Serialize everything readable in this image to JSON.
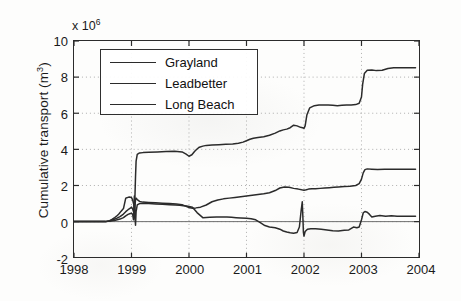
{
  "chart_data": {
    "type": "line",
    "title": "",
    "subtitle": "",
    "xlabel": "",
    "ylabel": "Cumulative transport (m3)",
    "ylabel_display": "Cumulative transport (m",
    "ylabel_sup": "3",
    "ylabel_tail": ")",
    "y_exponent_prefix": "x 10",
    "y_exponent_power": "6",
    "y_scale": 1000000,
    "xlim": [
      1998,
      2004
    ],
    "ylim": [
      -2,
      10
    ],
    "grid": true,
    "legend_position": "upper-left",
    "xticks": [
      "1998",
      "1999",
      "2000",
      "2001",
      "2002",
      "2003",
      "2004"
    ],
    "yticks": [
      "-2",
      "0",
      "2",
      "4",
      "6",
      "8",
      "10"
    ],
    "series": [
      {
        "name": "Grayland",
        "color": "#2b2b2b",
        "x": [
          1998.0,
          1998.55,
          1998.62,
          1998.66,
          1998.7,
          1998.74,
          1998.78,
          1998.82,
          1998.86,
          1998.9,
          1998.92,
          1998.94,
          1998.96,
          1998.98,
          1999.0,
          1999.02,
          1999.04,
          1999.05,
          1999.06,
          1999.07,
          1999.08,
          1999.1,
          1999.14,
          1999.2,
          1999.3,
          1999.45,
          1999.6,
          1999.75,
          1999.88,
          1999.95,
          2000.0,
          2000.05,
          2000.1,
          2000.14,
          2000.18,
          2000.24,
          2000.3,
          2000.4,
          2000.52,
          2000.64,
          2000.76,
          2000.86,
          2000.94,
          2001.0,
          2001.06,
          2001.12,
          2001.2,
          2001.3,
          2001.4,
          2001.5,
          2001.58,
          2001.64,
          2001.7,
          2001.76,
          2001.82,
          2001.88,
          2001.94,
          2001.99,
          2002.0,
          2002.02,
          2002.05,
          2002.1,
          2002.18,
          2002.26,
          2002.34,
          2002.42,
          2002.5,
          2002.58,
          2002.66,
          2002.74,
          2002.82,
          2002.9,
          2002.96,
          2003.0,
          2003.02,
          2003.05,
          2003.1,
          2003.18,
          2003.26,
          2003.36,
          2003.46,
          2003.56,
          2003.66,
          2003.76,
          2003.86,
          2003.94
        ],
        "y": [
          0.0,
          0.0,
          0.05,
          0.12,
          0.2,
          0.3,
          0.42,
          0.58,
          0.72,
          1.3,
          1.32,
          1.34,
          1.36,
          1.35,
          1.33,
          1.2,
          0.95,
          0.6,
          1.4,
          2.5,
          3.35,
          3.72,
          3.8,
          3.82,
          3.84,
          3.86,
          3.88,
          3.9,
          3.86,
          3.74,
          3.62,
          3.7,
          3.9,
          4.02,
          4.12,
          4.18,
          4.22,
          4.24,
          4.26,
          4.28,
          4.3,
          4.34,
          4.4,
          4.48,
          4.56,
          4.62,
          4.66,
          4.7,
          4.78,
          4.9,
          5.02,
          5.08,
          5.12,
          5.2,
          5.34,
          5.3,
          5.22,
          5.18,
          5.16,
          5.3,
          5.9,
          6.3,
          6.42,
          6.46,
          6.46,
          6.46,
          6.44,
          6.42,
          6.44,
          6.46,
          6.46,
          6.48,
          6.55,
          6.9,
          7.6,
          8.2,
          8.38,
          8.4,
          8.36,
          8.38,
          8.48,
          8.52,
          8.52,
          8.52,
          8.52,
          8.52
        ]
      },
      {
        "name": "Leadbetter",
        "color": "#2b2b2b",
        "x": [
          1998.0,
          1998.55,
          1998.62,
          1998.68,
          1998.74,
          1998.8,
          1998.86,
          1998.9,
          1998.94,
          1998.98,
          1999.0,
          1999.02,
          1999.04,
          1999.05,
          1999.06,
          1999.07,
          1999.08,
          1999.1,
          1999.14,
          1999.2,
          1999.3,
          1999.42,
          1999.54,
          1999.66,
          1999.78,
          1999.88,
          1999.94,
          2000.0,
          2000.06,
          2000.12,
          2000.2,
          2000.3,
          2000.4,
          2000.5,
          2000.6,
          2000.7,
          2000.8,
          2000.9,
          2001.0,
          2001.1,
          2001.2,
          2001.3,
          2001.4,
          2001.5,
          2001.58,
          2001.66,
          2001.74,
          2001.82,
          2001.9,
          2001.96,
          2002.0,
          2002.04,
          2002.08,
          2002.14,
          2002.2,
          2002.28,
          2002.36,
          2002.44,
          2002.52,
          2002.6,
          2002.7,
          2002.8,
          2002.9,
          2002.96,
          2003.0,
          2003.03,
          2003.06,
          2003.1,
          2003.18,
          2003.28,
          2003.4,
          2003.52,
          2003.64,
          2003.76,
          2003.86,
          2003.94
        ],
        "y": [
          0.0,
          0.0,
          0.04,
          0.1,
          0.18,
          0.28,
          0.42,
          0.55,
          0.66,
          0.74,
          0.8,
          0.7,
          0.5,
          0.3,
          0.85,
          1.22,
          1.3,
          1.22,
          1.12,
          1.08,
          1.06,
          1.04,
          1.02,
          1.0,
          0.98,
          0.94,
          0.86,
          0.78,
          0.74,
          0.76,
          0.8,
          0.92,
          1.1,
          1.2,
          1.26,
          1.3,
          1.34,
          1.38,
          1.42,
          1.46,
          1.5,
          1.54,
          1.6,
          1.72,
          1.86,
          1.92,
          1.9,
          1.84,
          1.8,
          1.76,
          1.74,
          1.76,
          1.8,
          1.82,
          1.82,
          1.84,
          1.86,
          1.88,
          1.9,
          1.92,
          1.94,
          1.96,
          2.0,
          2.1,
          2.35,
          2.7,
          2.88,
          2.92,
          2.9,
          2.88,
          2.9,
          2.9,
          2.9,
          2.9,
          2.9,
          2.9
        ]
      },
      {
        "name": "Long Beach",
        "color": "#2b2b2b",
        "x": [
          1998.0,
          1998.55,
          1998.64,
          1998.72,
          1998.8,
          1998.86,
          1998.9,
          1998.94,
          1998.98,
          1999.0,
          1999.02,
          1999.035,
          1999.045,
          1999.05,
          1999.055,
          1999.06,
          1999.07,
          1999.08,
          1999.1,
          1999.14,
          1999.2,
          1999.3,
          1999.42,
          1999.54,
          1999.66,
          1999.76,
          1999.84,
          1999.9,
          1999.96,
          2000.0,
          2000.06,
          2000.14,
          2000.24,
          2000.36,
          2000.48,
          2000.58,
          2000.66,
          2000.74,
          2000.82,
          2000.9,
          2001.0,
          2001.08,
          2001.16,
          2001.24,
          2001.32,
          2001.4,
          2001.5,
          2001.58,
          2001.64,
          2001.7,
          2001.76,
          2001.82,
          2001.88,
          2001.92,
          2001.95,
          2001.97,
          2001.98,
          2001.99,
          2002.0,
          2002.02,
          2002.06,
          2002.12,
          2002.2,
          2002.3,
          2002.4,
          2002.5,
          2002.6,
          2002.7,
          2002.78,
          2002.86,
          2002.92,
          2002.96,
          2003.0,
          2003.03,
          2003.06,
          2003.1,
          2003.14,
          2003.18,
          2003.24,
          2003.32,
          2003.42,
          2003.52,
          2003.62,
          2003.72,
          2003.82,
          2003.9,
          2003.94
        ],
        "y": [
          0.0,
          0.0,
          0.03,
          0.08,
          0.14,
          0.22,
          0.32,
          0.4,
          0.45,
          0.46,
          0.4,
          0.1,
          1.05,
          1.42,
          0.95,
          0.3,
          -0.2,
          0.55,
          0.92,
          1.0,
          1.02,
          1.0,
          0.98,
          0.96,
          0.94,
          0.92,
          0.9,
          0.88,
          0.86,
          0.84,
          0.8,
          0.5,
          0.22,
          0.24,
          0.26,
          0.26,
          0.26,
          0.24,
          0.22,
          0.2,
          0.18,
          0.16,
          0.1,
          -0.06,
          -0.22,
          -0.3,
          -0.34,
          -0.42,
          -0.52,
          -0.58,
          -0.62,
          -0.64,
          -0.6,
          -0.3,
          0.6,
          1.1,
          0.3,
          -0.6,
          -0.8,
          -0.55,
          -0.42,
          -0.4,
          -0.4,
          -0.42,
          -0.46,
          -0.5,
          -0.52,
          -0.48,
          -0.46,
          -0.3,
          -0.34,
          -0.3,
          0.1,
          0.48,
          0.56,
          0.52,
          0.4,
          0.26,
          0.3,
          0.34,
          0.3,
          0.32,
          0.3,
          0.3,
          0.3,
          0.3,
          0.3
        ]
      }
    ],
    "legend": [
      {
        "label": "Grayland"
      },
      {
        "label": "Leadbetter"
      },
      {
        "label": "Long Beach"
      }
    ]
  }
}
